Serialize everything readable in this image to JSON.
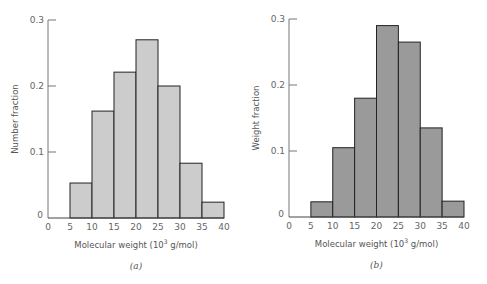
{
  "chart_data": [
    {
      "type": "bar",
      "panel_label": "(a)",
      "title": "",
      "xlabel": "Molecular weight (10^3 g/mol)",
      "xlabel_main": "Molecular weight (10",
      "xlabel_sup": "3",
      "xlabel_tail": " g/mol)",
      "ylabel": "Number fraction",
      "bin_edges": [
        5,
        10,
        15,
        20,
        25,
        30,
        35,
        40
      ],
      "categories": [
        "5-10",
        "10-15",
        "15-20",
        "20-25",
        "25-30",
        "30-35",
        "35-40"
      ],
      "values": [
        0.053,
        0.162,
        0.221,
        0.27,
        0.2,
        0.083,
        0.024
      ],
      "xlim": [
        0,
        40
      ],
      "ylim": [
        0,
        0.3
      ],
      "xticks": [
        "0",
        "5",
        "10",
        "15",
        "20",
        "25",
        "30",
        "35",
        "40"
      ],
      "yticks": [
        "0",
        "0.1",
        "0.2",
        "0.3"
      ],
      "bar_color": "#cccccc",
      "grid": false,
      "legend": null
    },
    {
      "type": "bar",
      "panel_label": "(b)",
      "title": "",
      "xlabel": "Molecular weight (10^3 g/mol)",
      "xlabel_main": "Molecular weight (10",
      "xlabel_sup": "3",
      "xlabel_tail": " g/mol)",
      "ylabel": "Weight fraction",
      "bin_edges": [
        5,
        10,
        15,
        20,
        25,
        30,
        35,
        40
      ],
      "categories": [
        "5-10",
        "10-15",
        "15-20",
        "20-25",
        "25-30",
        "30-35",
        "35-40"
      ],
      "values": [
        0.023,
        0.105,
        0.18,
        0.29,
        0.265,
        0.135,
        0.024
      ],
      "xlim": [
        0,
        40
      ],
      "ylim": [
        0,
        0.3
      ],
      "xticks": [
        "0",
        "5",
        "10",
        "15",
        "20",
        "25",
        "30",
        "35",
        "40"
      ],
      "yticks": [
        "0",
        "0.1",
        "0.2",
        "0.3"
      ],
      "bar_color": "#9a9a9a",
      "grid": false,
      "legend": null
    }
  ]
}
